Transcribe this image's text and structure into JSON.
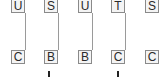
{
  "diagram": {
    "columns": [
      {
        "top": "U",
        "bottom": "C",
        "connected": true
      },
      {
        "top": "S",
        "bottom": "B",
        "connected": true
      },
      {
        "top": "U",
        "bottom": "B",
        "connected": true
      },
      {
        "top": "T",
        "bottom": "C",
        "connected": true
      },
      {
        "top": "S",
        "bottom": "C",
        "connected": false
      }
    ],
    "ticks_under_columns": [
      2,
      4
    ],
    "colors": {
      "node_border": "#8a8a8a",
      "node_fill": "#f4f4f4",
      "connector": "#9a9a9a",
      "tick": "#222222",
      "text": "#2a2a2a"
    }
  }
}
